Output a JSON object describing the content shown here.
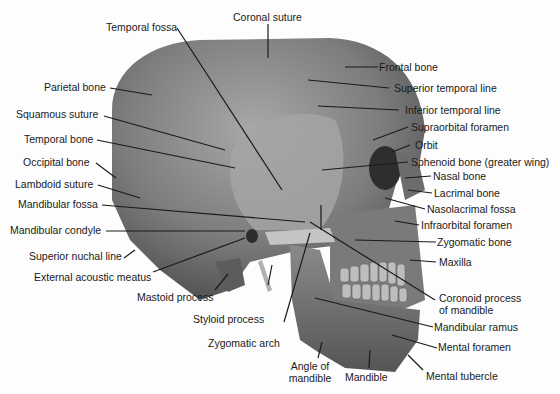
{
  "diagram": {
    "colors": {
      "background": "#fdfdfd",
      "bone_dark": "#5a5a5a",
      "bone_mid": "#8a8a8a",
      "bone_light": "#b8b8b8",
      "leader": "#1a1a1a",
      "text": "#1a1a1a"
    },
    "labels_left": [
      "Parietal bone",
      "Squamous suture",
      "Temporal bone",
      "Occipital bone",
      "Lambdoid suture",
      "Mandibular fossa",
      "Mandibular condyle",
      "Superior nuchal line",
      "External acoustic meatus"
    ],
    "labels_top": [
      "Temporal fossa",
      "Coronal suture"
    ],
    "labels_right": [
      "Frontal bone",
      "Superior temporal line",
      "Inferior temporal line",
      "Supraorbital foramen",
      "Orbit",
      "Sphenoid bone (greater wing)",
      "Nasal bone",
      "Lacrimal bone",
      "Nasolacrimal fossa",
      "Infraorbital foramen",
      "Zygomatic bone",
      "Maxilla",
      "Coronoid process",
      "of mandible",
      "Mandibular ramus",
      "Mental foramen",
      "Mental tubercle"
    ],
    "labels_bottom": [
      "Mastoid process",
      "Styloid process",
      "Zygomatic arch",
      "Angle of",
      "mandible",
      "Mandible"
    ]
  }
}
